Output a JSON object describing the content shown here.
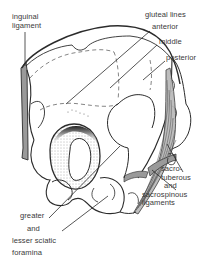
{
  "figure": {
    "colors": {
      "background": "#ffffff",
      "line": "#2b2b2b",
      "ligament_fill": "#9a9a9a",
      "label_text": "#3a3a3a"
    }
  },
  "labels": {
    "inguinal": {
      "line1": "inguinal",
      "line2": "ligament"
    },
    "gluteal_heading": "gluteal lines",
    "gluteal_anterior": "anterior",
    "gluteal_middle": "middle",
    "gluteal_posterior": "posterior",
    "sacro": {
      "line1": "sacro-",
      "line2": "tuberous",
      "line3": "and",
      "line4": "sacrospinous",
      "line5": "ligaments"
    },
    "sciatic": {
      "line1": "greater",
      "line2": "and",
      "line3": "lesser sciatic",
      "line4": "foramina"
    }
  }
}
